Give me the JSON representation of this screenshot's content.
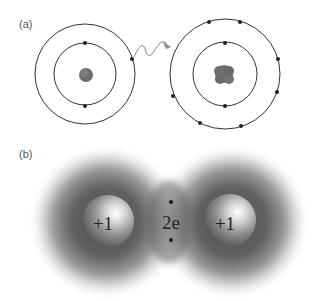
{
  "panels": {
    "a": {
      "label": "(a)",
      "description": "Bohr models: electron emitted from one atom and captured by another",
      "left_atom": {
        "center": [
          85,
          74
        ],
        "inner_shell_radius": 31,
        "outer_shell_radius": 50,
        "inner_electrons": 2,
        "outer_electrons": 1,
        "nucleus_radius": 7
      },
      "right_atom": {
        "center": [
          225,
          74
        ],
        "inner_shell_radius": 32,
        "outer_shell_radius": 55,
        "inner_electrons": 2,
        "outer_electrons": 7,
        "nucleus_radius": 10
      },
      "transfer_arrow": "wavy-arrow"
    },
    "b": {
      "label": "(b)",
      "description": "Covalent bond: two nuclei sharing an electron pair",
      "left_nucleus_charge": "+1",
      "right_nucleus_charge": "+1",
      "shared_electrons_label": "2e",
      "shared_electron_count": 2
    }
  },
  "colors": {
    "line": "#333333",
    "electron": "#222222",
    "nucleus": "#6e6e6e",
    "arrow": "#8a8a8a",
    "cloud": "#4a4a4a",
    "text": "#222222"
  }
}
